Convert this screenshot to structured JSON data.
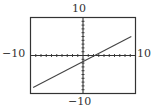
{
  "chart_data": {
    "type": "line",
    "title": "",
    "xlabel": "",
    "ylabel": "",
    "xlim": [
      -10,
      10
    ],
    "ylim": [
      -10,
      10
    ],
    "xscale": 1,
    "yscale": 1,
    "grid": false,
    "legend": "none",
    "tick_labels": {
      "x_min": "−10",
      "x_max": "10",
      "y_min": "−10",
      "y_max": "10"
    },
    "series": [
      {
        "name": "line",
        "equation_estimate": "y = 0.7x - 1.5",
        "x": [
          -9.5,
          9.2
        ],
        "y": [
          -8.4,
          5.0
        ]
      }
    ],
    "colors": {
      "frame": "#333333",
      "axes": "#333333",
      "line": "#444444"
    }
  },
  "labels": {
    "top": "10",
    "bottom": "−10",
    "left": "−10",
    "right": "10"
  }
}
